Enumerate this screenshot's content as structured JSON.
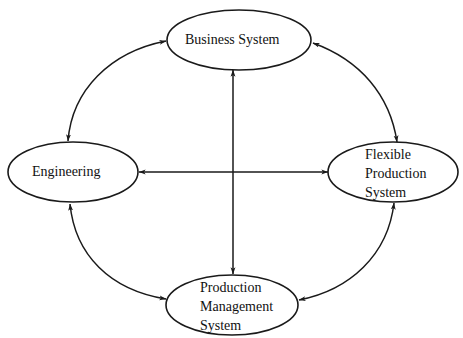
{
  "diagram": {
    "type": "system-interaction-diagram",
    "line_color": "#1a1a1a",
    "background": "#ffffff",
    "nodes": [
      {
        "id": "business-system",
        "shape": "ellipse",
        "label_lines": [
          "Business System"
        ]
      },
      {
        "id": "engineering",
        "shape": "ellipse",
        "label_lines": [
          "Engineering"
        ]
      },
      {
        "id": "flexible-production-system",
        "shape": "ellipse",
        "label_lines": [
          "Flexible",
          "Production",
          "System"
        ]
      },
      {
        "id": "production-management-system",
        "shape": "ellipse",
        "label_lines": [
          "Production",
          "Management",
          "System"
        ]
      }
    ],
    "edges": [
      {
        "from": "business-system",
        "to": "engineering",
        "style": "curved",
        "arrows": "both"
      },
      {
        "from": "business-system",
        "to": "flexible-production-system",
        "style": "curved",
        "arrows": "both"
      },
      {
        "from": "engineering",
        "to": "production-management-system",
        "style": "curved",
        "arrows": "both"
      },
      {
        "from": "flexible-production-system",
        "to": "production-management-system",
        "style": "curved",
        "arrows": "both"
      },
      {
        "from": "business-system",
        "to": "production-management-system",
        "style": "straight-vertical",
        "arrows": "both"
      },
      {
        "from": "engineering",
        "to": "flexible-production-system",
        "style": "straight-horizontal",
        "arrows": "both"
      }
    ]
  }
}
